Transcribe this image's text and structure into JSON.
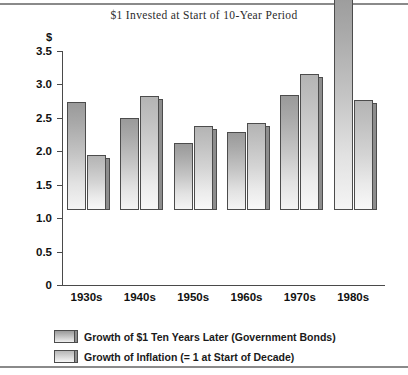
{
  "chart_data": {
    "type": "bar",
    "title": "$1 Invested at Start of 10-Year Period",
    "xlabel": "",
    "ylabel": "$",
    "ylim": [
      0,
      3.5
    ],
    "yticks": [
      "0",
      "0.5",
      "1.0",
      "1.5",
      "2.0",
      "2.5",
      "3.0",
      "3.5"
    ],
    "ytick_values": [
      0,
      0.5,
      1.0,
      1.5,
      2.0,
      2.5,
      3.0,
      3.5
    ],
    "grid": false,
    "legend_position": "bottom-left",
    "categories": [
      "1930s",
      "1940s",
      "1950s",
      "1960s",
      "1970s",
      "1980s"
    ],
    "series": [
      {
        "name": "Growth of $1 Ten Years Later (Government Bonds)",
        "values": [
          1.62,
          1.38,
          1.0,
          1.17,
          1.72,
          3.3
        ]
      },
      {
        "name": "Growth of Inflation (= 1 at Start of Decade)",
        "values": [
          0.82,
          1.7,
          1.25,
          1.3,
          2.03,
          1.65
        ]
      }
    ]
  },
  "colors": {
    "bar_series_1": "#a8a8a8",
    "bar_series_2": "#c8c8c8",
    "bar_outline": "#4c4c4c",
    "bar_shadow": "#8d8d8d",
    "axis": "#4a4a4a",
    "rule": "#8a8a8a",
    "text": "#111111",
    "title_text": "#2b2b2b"
  }
}
